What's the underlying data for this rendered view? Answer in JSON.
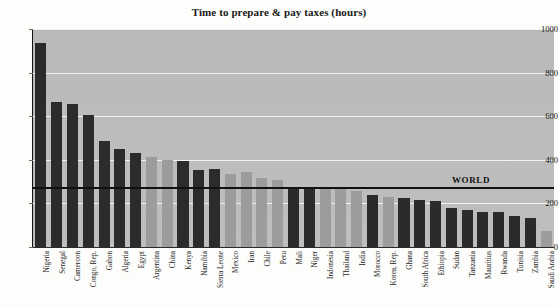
{
  "chart_data": {
    "type": "bar",
    "title": "Time to prepare & pay taxes (hours)",
    "xlabel": "",
    "ylabel": "",
    "ylim": [
      0,
      1000
    ],
    "ytick_values": [
      0,
      200,
      400,
      600,
      800,
      1000
    ],
    "ytick_labels": [
      "0",
      "200",
      "400",
      "600",
      "800",
      "1000"
    ],
    "grid": "horizontal-white-gridlines",
    "legend": "none",
    "plot_background": "#bdbdbd",
    "colors": {
      "dark_bar": "#2b2b2b",
      "light_bar": "#9c9c9c",
      "gridline": "#f2f2f0",
      "axis": "#15150f",
      "reference_line": "#111110"
    },
    "annotations": [
      {
        "name": "WORLD",
        "label": "WORLD",
        "type": "horizontal-reference-line",
        "value": 270,
        "label_position": "right-above-line"
      }
    ],
    "categories": [
      "Nigeria",
      "Senegal",
      "Cameroon",
      "Congo, Rep.",
      "Gabon",
      "Algeria",
      "Egypt",
      "Argentina",
      "China",
      "Kenya",
      "Namibia",
      "Sierra Leone",
      "Mexico",
      "Iran",
      "Chile",
      "Peru",
      "Mali",
      "Niger",
      "Indonesia",
      "Thailand",
      "India",
      "Morocco",
      "Korea, Rep.",
      "Ghana",
      "South Africa",
      "Ethiopia",
      "Sudan",
      "Tanzania",
      "Mauritius",
      "Rwanda",
      "Tunisia",
      "Zambia",
      "Saudi Arabia"
    ],
    "values": [
      936,
      666,
      654,
      606,
      488,
      451,
      433,
      415,
      398,
      393,
      355,
      357,
      337,
      344,
      316,
      309,
      270,
      266,
      266,
      264,
      258,
      238,
      230,
      224,
      216,
      211,
      180,
      172,
      161,
      160,
      144,
      132,
      72
    ],
    "series": [
      {
        "name": "Time to prepare & pay taxes (hours)",
        "values": [
          936,
          666,
          654,
          606,
          488,
          451,
          433,
          415,
          398,
          393,
          355,
          357,
          337,
          344,
          316,
          309,
          270,
          266,
          266,
          264,
          258,
          238,
          230,
          224,
          216,
          211,
          180,
          172,
          161,
          160,
          144,
          132,
          72
        ]
      }
    ],
    "bar_shades": [
      "dark",
      "dark",
      "dark",
      "dark",
      "dark",
      "dark",
      "dark",
      "light",
      "light",
      "dark",
      "dark",
      "dark",
      "light",
      "light",
      "light",
      "light",
      "dark",
      "dark",
      "light",
      "light",
      "light",
      "dark",
      "light",
      "dark",
      "dark",
      "dark",
      "dark",
      "dark",
      "dark",
      "dark",
      "dark",
      "dark",
      "light"
    ]
  }
}
